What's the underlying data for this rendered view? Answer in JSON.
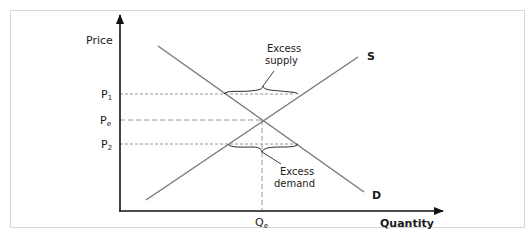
{
  "diagram": {
    "type": "supply-demand",
    "axes": {
      "y_label": "Price",
      "x_label": "Quantity"
    },
    "price_levels": [
      {
        "id": "p1",
        "main": "P",
        "sub": "1"
      },
      {
        "id": "pe",
        "main": "P",
        "sub": "e"
      },
      {
        "id": "p2",
        "main": "P",
        "sub": "2"
      }
    ],
    "quantity_levels": [
      {
        "id": "qe",
        "main": "Q",
        "sub": "e"
      }
    ],
    "curves": {
      "supply_label": "S",
      "demand_label": "D"
    },
    "annotations": {
      "excess_supply": [
        "Excess",
        "supply"
      ],
      "excess_demand": [
        "Excess",
        "demand"
      ]
    },
    "colors": {
      "axis": "#111111",
      "curve": "#7a7a7a",
      "guide": "#8a8a8a",
      "frame": "#d8d8d8"
    }
  }
}
